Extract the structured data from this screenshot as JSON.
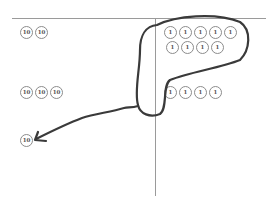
{
  "diagram": {
    "colors": {
      "background": "#ffffff",
      "grid_line": "#9a9a9a",
      "coin_border": "#8c8c8c",
      "coin_text": "#555555",
      "ink": "#3a3a3a"
    },
    "tens_column": {
      "rows": [
        {
          "coins": [
            "10",
            "10"
          ]
        },
        {
          "coins": [
            "10",
            "10",
            "10"
          ]
        },
        {
          "coins": [
            "10"
          ]
        }
      ]
    },
    "ones_column": {
      "rows": [
        {
          "coins": [
            "1",
            "1",
            "1",
            "1",
            "1"
          ]
        },
        {
          "coins": [
            "1",
            "1",
            "1",
            "1"
          ]
        },
        {
          "coins": [
            "1",
            "1",
            "1",
            "1"
          ]
        }
      ]
    },
    "annotations": [
      {
        "type": "loop",
        "label": "group-of-ten-ones"
      },
      {
        "type": "arrow",
        "label": "regroup-to-ten"
      }
    ]
  }
}
